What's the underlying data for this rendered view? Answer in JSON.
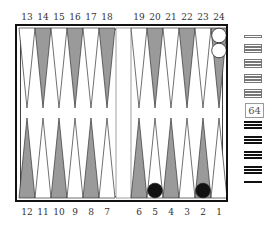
{
  "board": {
    "top_labels": [
      "13",
      "14",
      "15",
      "16",
      "17",
      "18",
      "19",
      "20",
      "21",
      "22",
      "23",
      "24"
    ],
    "bottom_labels": [
      "12",
      "11",
      "10",
      "9",
      "8",
      "7",
      "6",
      "5",
      "4",
      "3",
      "2",
      "1"
    ],
    "colors": {
      "frame": "#111111",
      "dark_point": "#9a9a9a",
      "light_point": "#ffffff",
      "white_checker": "#ffffff",
      "black_checker": "#111111"
    },
    "checkers": [
      {
        "point": 24,
        "color": "white",
        "count": 2
      },
      {
        "point": 5,
        "color": "black",
        "count": 1
      },
      {
        "point": 2,
        "color": "black",
        "count": 1
      }
    ]
  },
  "tray": {
    "white_off_stacks": [
      1,
      3,
      3,
      3,
      3
    ],
    "black_off_stacks": [
      3,
      3,
      3,
      3,
      1
    ],
    "cube_value": "64"
  }
}
